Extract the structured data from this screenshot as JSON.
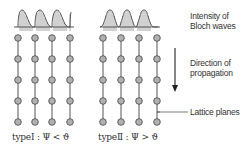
{
  "labels": {
    "intensity_line1": "Intensity of",
    "intensity_line2": "Bloch waves",
    "direction_line1": "Direction of",
    "direction_line2": "propagation",
    "lattice": "Lattice planes",
    "type1": "typeⅠ : Ψ < ϑ",
    "type2": "typeⅡ : Ψ > ϑ"
  },
  "colors": {
    "node_fill": "#b0b0b0",
    "node_stroke": "#555555",
    "line": "#444444",
    "text": "#333333"
  },
  "lattice": {
    "type1_columns_x": [
      18,
      35,
      52,
      70
    ],
    "type2_columns_x": [
      103,
      121,
      139,
      157
    ],
    "rows_y": [
      38,
      59,
      80,
      101,
      122
    ]
  }
}
